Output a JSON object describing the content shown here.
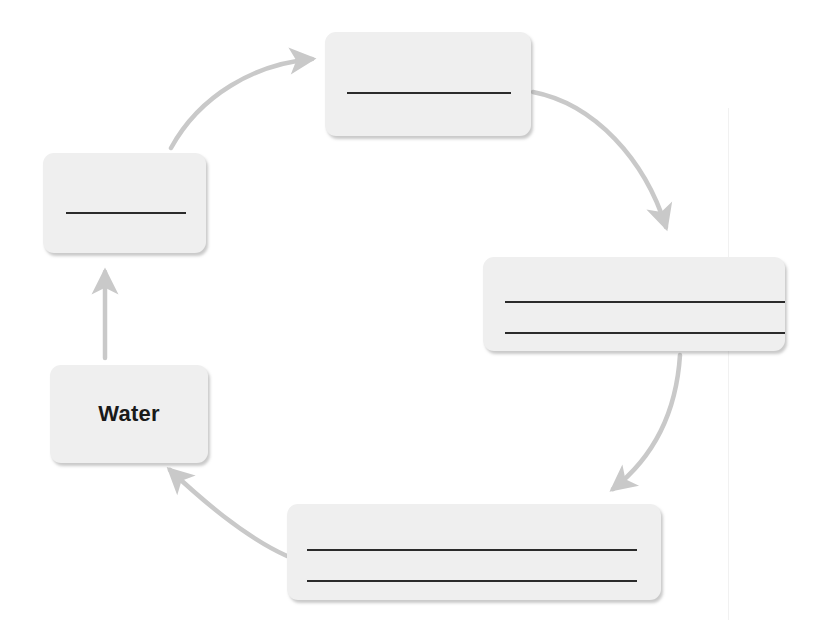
{
  "diagram": {
    "type": "cycle",
    "background_color": "#ffffff",
    "node_fill_color": "#efefef",
    "rule_color": "#2b2b2b",
    "arrow_color": "#c9c9c9",
    "nodes": [
      {
        "id": "water",
        "label": "Water",
        "blank_lines": 0,
        "filled": true,
        "position": "left-lower"
      },
      {
        "id": "left",
        "label": "",
        "blank_lines": 1,
        "filled": false,
        "position": "left-upper"
      },
      {
        "id": "top",
        "label": "",
        "blank_lines": 1,
        "filled": false,
        "position": "top"
      },
      {
        "id": "right",
        "label": "",
        "blank_lines": 2,
        "filled": false,
        "position": "right"
      },
      {
        "id": "bottom",
        "label": "",
        "blank_lines": 2,
        "filled": false,
        "position": "bottom"
      }
    ],
    "arrows": [
      {
        "id": "water-to-left",
        "from": "water",
        "to": "left",
        "style": "straight-up"
      },
      {
        "id": "left-to-top",
        "from": "left",
        "to": "top",
        "style": "curve-up-right"
      },
      {
        "id": "top-to-right",
        "from": "top",
        "to": "right",
        "style": "curve-down-right"
      },
      {
        "id": "right-to-bottom",
        "from": "right",
        "to": "bottom",
        "style": "curve-down-left"
      },
      {
        "id": "bottom-to-water",
        "from": "bottom",
        "to": "water",
        "style": "curve-up-left"
      }
    ]
  }
}
